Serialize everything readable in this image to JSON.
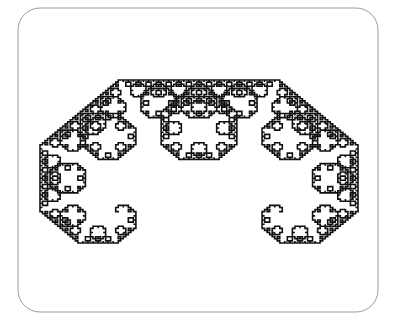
{
  "figure": {
    "kind": "fractal-curve",
    "curve_name": "Levy C curve",
    "background_color": "#ffffff"
  },
  "canvas": {
    "width": 397,
    "height": 323,
    "view_box": "0 0 397 323"
  },
  "frame": {
    "name": "rounded-rectangle-border",
    "x": 18,
    "y": 8,
    "width": 360,
    "height": 304,
    "corner_radius": 22,
    "stroke_color": "#9a9a9a",
    "stroke_width": 1,
    "fill": "none"
  },
  "chart_data": {
    "type": "line",
    "xlabel": "",
    "ylabel": "",
    "grid": false,
    "legend": "none",
    "axis_visible": false,
    "xlim": [
      18,
      378
    ],
    "ylim": [
      8,
      312
    ],
    "curve": {
      "name": "Levy C curve",
      "iterations": 12,
      "start_point": [
        40,
        243
      ],
      "end_point": [
        358,
        243
      ],
      "apex_point": [
        197.5,
        80
      ],
      "base_span": 318,
      "height": 163,
      "turn_angle_degrees": 45,
      "scale_factor": 0.7071067811865476,
      "stroke_color": "#111111",
      "stroke_width": 1.6,
      "segment_count": 4096
    }
  },
  "annotations": {
    "visible_text": []
  }
}
